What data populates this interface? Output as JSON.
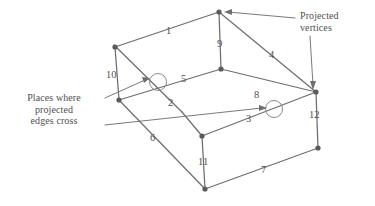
{
  "figure": {
    "colors": {
      "edge": "#6e6e6e",
      "leader": "#7a7a7a",
      "vertex": "#5a5a5a",
      "crossing_circle": "#8b8b8b",
      "text": "#4f4f4f",
      "background": "#ffffff"
    },
    "annotations": {
      "projected_vertices": {
        "line1": "Projected",
        "line2": "vertices"
      },
      "places_where": {
        "line1": "Places where",
        "line2": "projected",
        "line3": "edges cross"
      }
    },
    "edge_labels": [
      {
        "id": "edge-label-1",
        "text": "1",
        "x": 166,
        "y": 25
      },
      {
        "id": "edge-label-2",
        "text": "2",
        "x": 168,
        "y": 97
      },
      {
        "id": "edge-label-3",
        "text": "3",
        "x": 246,
        "y": 113
      },
      {
        "id": "edge-label-4",
        "text": "4",
        "x": 269,
        "y": 49
      },
      {
        "id": "edge-label-5",
        "text": "5",
        "x": 181,
        "y": 73
      },
      {
        "id": "edge-label-6",
        "text": "6",
        "x": 150,
        "y": 132
      },
      {
        "id": "edge-label-7",
        "text": "7",
        "x": 261,
        "y": 164
      },
      {
        "id": "edge-label-8",
        "text": "8",
        "x": 254,
        "y": 89
      },
      {
        "id": "edge-label-9",
        "text": "9",
        "x": 217,
        "y": 38
      },
      {
        "id": "edge-label-10",
        "text": "10",
        "x": 108,
        "y": 69
      },
      {
        "id": "edge-label-11",
        "text": "11",
        "x": 198,
        "y": 156
      },
      {
        "id": "edge-label-12",
        "text": "12",
        "x": 311,
        "y": 109
      }
    ],
    "vertices": [
      {
        "name": "vertex-top",
        "x": 219,
        "y": 12
      },
      {
        "name": "vertex-upper-left",
        "x": 115,
        "y": 47
      },
      {
        "name": "vertex-mid-center",
        "x": 221,
        "y": 69
      },
      {
        "name": "vertex-left",
        "x": 119,
        "y": 100
      },
      {
        "name": "vertex-right",
        "x": 316,
        "y": 92
      },
      {
        "name": "vertex-inner-bottom",
        "x": 202,
        "y": 136
      },
      {
        "name": "vertex-bottom-right",
        "x": 318,
        "y": 148
      },
      {
        "name": "vertex-bottom",
        "x": 205,
        "y": 189
      }
    ],
    "crossings": [
      {
        "name": "crossing-left",
        "x": 158,
        "y": 82,
        "r": 8
      },
      {
        "name": "crossing-right",
        "x": 274,
        "y": 109,
        "r": 8
      }
    ],
    "edges": [
      {
        "name": "edge-1",
        "x1": 115,
        "y1": 47,
        "x2": 219,
        "y2": 12
      },
      {
        "name": "edge-9",
        "x1": 219,
        "y1": 12,
        "x2": 221,
        "y2": 69
      },
      {
        "name": "edge-4",
        "x1": 219,
        "y1": 12,
        "x2": 316,
        "y2": 92
      },
      {
        "name": "edge-10",
        "x1": 115,
        "y1": 47,
        "x2": 119,
        "y2": 100
      },
      {
        "name": "edge-2",
        "x1": 115,
        "y1": 47,
        "x2": 180,
        "y2": 110
      },
      {
        "name": "edge-5",
        "x1": 119,
        "y1": 100,
        "x2": 221,
        "y2": 69
      },
      {
        "name": "edge-8",
        "x1": 221,
        "y1": 69,
        "x2": 316,
        "y2": 92
      },
      {
        "name": "edge-12",
        "x1": 316,
        "y1": 92,
        "x2": 318,
        "y2": 148
      },
      {
        "name": "edge-6",
        "x1": 119,
        "y1": 100,
        "x2": 205,
        "y2": 189
      },
      {
        "name": "edge-3",
        "x1": 202,
        "y1": 136,
        "x2": 316,
        "y2": 92
      },
      {
        "name": "edge-11",
        "x1": 202,
        "y1": 136,
        "x2": 205,
        "y2": 189
      },
      {
        "name": "edge-inner-left",
        "x1": 180,
        "y1": 110,
        "x2": 202,
        "y2": 136
      },
      {
        "name": "edge-7",
        "x1": 205,
        "y1": 189,
        "x2": 318,
        "y2": 148
      }
    ]
  }
}
